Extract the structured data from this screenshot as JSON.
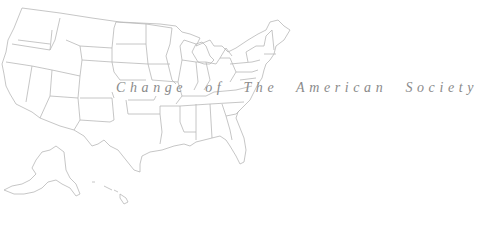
{
  "title": "Change of The American Society",
  "map": {
    "subject": "United States state outline map",
    "stroke_color": "#b8b8b8",
    "background": "#ffffff",
    "insets": [
      "Alaska",
      "Hawaii"
    ]
  },
  "caption_color": "#8a8a8a"
}
